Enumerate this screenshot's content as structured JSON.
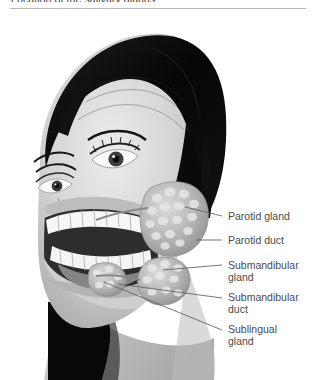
{
  "header": {
    "title": "Location of the salivary glands"
  },
  "illustration": {
    "alt_name": "salivary-glands-anatomical-illustration",
    "description": "Grayscale three-quarter view of a woman's head with a cutaway of the cheek revealing the teeth, mandible and the three paired salivary glands",
    "palette": {
      "background": "#ffffff",
      "hair_dark": "#0d0d0d",
      "skin_light": "#e3e3e3",
      "skin_mid": "#c9c9c9",
      "skin_shadow": "#a8a8a8",
      "gland_fill": "#b5b5b5",
      "gland_highlight": "#ededed",
      "teeth_white": "#fafafa",
      "oral_cavity": "#2a2a2a",
      "leader_line": "#5d5d5d",
      "rule": "#b9b9b9",
      "label_text": "#4a4a4a"
    }
  },
  "labels": [
    {
      "text": "Parotid gland",
      "leader_from_x": 185,
      "leader_from_y": 195
    },
    {
      "text": "Parotid duct",
      "leader_from_x": 196,
      "leader_from_y": 228
    },
    {
      "text": "Submandibular gland",
      "leader_from_x": 163,
      "leader_from_y": 258
    },
    {
      "text": "Submandibular duct",
      "leader_from_x": 118,
      "leader_from_y": 272
    },
    {
      "text": "Sublingual gland",
      "leader_from_x": 104,
      "leader_from_y": 270
    }
  ]
}
